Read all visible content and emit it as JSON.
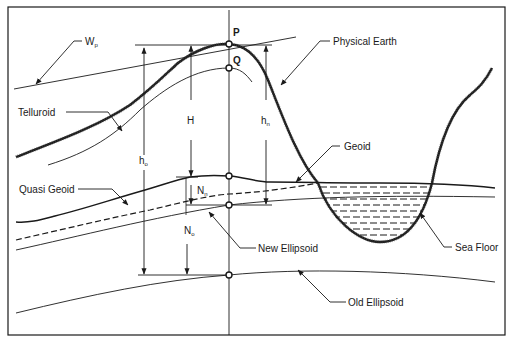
{
  "diagram": {
    "title": "",
    "labels": {
      "wp": "W",
      "wp_sub": "p",
      "physical_earth": "Physical Earth",
      "telluroid": "Telluroid",
      "geoid": "Geoid",
      "quasi_geoid": "Quasi Geoid",
      "new_ellipsoid": "New Ellipsoid",
      "old_ellipsoid": "Old Ellipsoid",
      "sea_floor": "Sea Floor"
    },
    "points": {
      "p": "P",
      "q": "Q"
    },
    "measures": {
      "H": "H",
      "hn": "h",
      "hn_sub": "n",
      "ho": "h",
      "ho_sub": "o",
      "Nn": "N",
      "Nn_sub": "n",
      "No": "N",
      "No_sub": "o"
    },
    "colors": {
      "ink": "#1a1a1a",
      "background": "#ffffff"
    }
  }
}
